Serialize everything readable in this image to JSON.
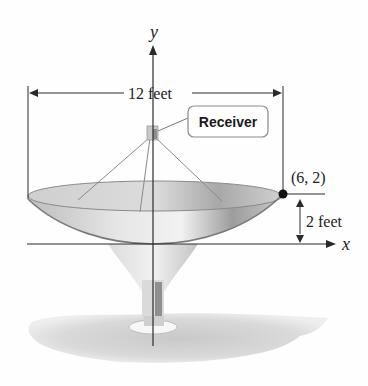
{
  "figure": {
    "axes": {
      "x_label": "x",
      "y_label": "y"
    },
    "dimensions": {
      "width_label": "12 feet",
      "depth_label": "2 feet"
    },
    "point": {
      "label": "(6, 2)"
    },
    "callout": {
      "label": "Receiver"
    },
    "colors": {
      "axis": "#2a2a2a",
      "dish_fill": "#c8c8c8",
      "dish_rim": "#8a8a8a",
      "shadow": "#d4d4d4",
      "point": "#111111"
    }
  }
}
